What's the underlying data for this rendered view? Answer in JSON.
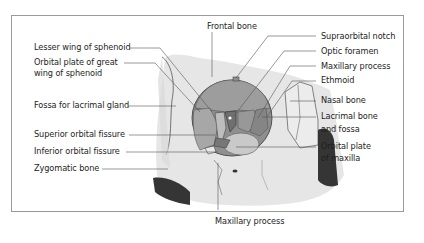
{
  "figure": {
    "labels_left": [
      {
        "id": "lesser-wing",
        "text": "Lesser wing of sphenoid"
      },
      {
        "id": "orbital-plate-great-wing",
        "line1": "Orbital plate of great",
        "line2": "wing of sphenoid"
      },
      {
        "id": "lacrimal-fossa",
        "text": "Fossa for lacrimal gland"
      },
      {
        "id": "superior-orbital-fissure",
        "text": "Superior orbital fissure"
      },
      {
        "id": "inferior-orbital-fissure",
        "text": "Inferior orbital fissure"
      },
      {
        "id": "zygomatic",
        "text": "Zygomatic bone"
      }
    ],
    "labels_top": [
      {
        "id": "frontal",
        "text": "Frontal bone"
      }
    ],
    "labels_right": [
      {
        "id": "supraorbital-notch",
        "text": "Supraorbital notch"
      },
      {
        "id": "optic-foramen",
        "text": "Optic foramen"
      },
      {
        "id": "maxillary-process-top",
        "text": "Maxillary process"
      },
      {
        "id": "ethmoid",
        "text": "Ethmoid"
      },
      {
        "id": "nasal",
        "text": "Nasal bone"
      },
      {
        "id": "lacrimal",
        "line1": "Lacrimal bone",
        "line2": "and fossa"
      },
      {
        "id": "orbital-plate-maxilla",
        "line1": "Orbital plate",
        "line2": "of maxilla"
      }
    ],
    "labels_bottom": [
      {
        "id": "maxillary-process-bottom",
        "text": "Maxillary process"
      }
    ],
    "colors": {
      "frame": "#9a9a9a",
      "skull_light": "#e2e2e2",
      "orbit_mid": "#9b9b9b",
      "orbit_dark": "#7d7d7d",
      "shadow": "#3a3a3a",
      "leader": "#555555"
    }
  }
}
